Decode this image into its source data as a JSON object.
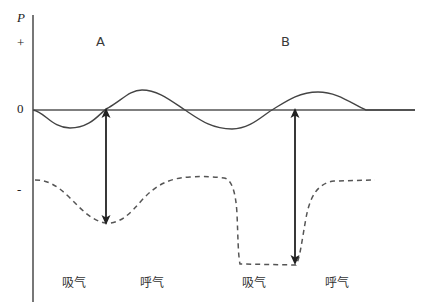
{
  "figure": {
    "background": "#ffffff",
    "width": 422,
    "height": 307,
    "line_color": "#444444",
    "dashed_color": "#555555",
    "arrow_color": "#222222"
  },
  "axes": {
    "y_axis_label": "P",
    "positive_label": "+",
    "zero_label": "0",
    "negative_label": "-",
    "y_axis_x": 33,
    "zero_line_y": 110
  },
  "cycles": [
    {
      "label": "A",
      "x": 100,
      "y": 42
    },
    {
      "label": "B",
      "x": 285,
      "y": 42
    }
  ],
  "phases": [
    {
      "label": "吸气",
      "x": 62,
      "y": 278
    },
    {
      "label": "呼气",
      "x": 140,
      "y": 278
    },
    {
      "label": "吸气",
      "x": 242,
      "y": 278
    },
    {
      "label": "呼气",
      "x": 325,
      "y": 278
    }
  ],
  "arrows": [
    {
      "name": "amplitude-arrow-a",
      "x": 106,
      "top": 108,
      "bottom": 225
    },
    {
      "name": "amplitude-arrow-b",
      "x": 295,
      "top": 108,
      "bottom": 265
    }
  ],
  "chart_data": {
    "type": "line",
    "title": "",
    "xlabel": "",
    "ylabel": "P",
    "ytick_labels": [
      "+",
      "0",
      "-"
    ],
    "grid": false,
    "legend": "none",
    "series": [
      {
        "name": "airway-pressure-solid",
        "style": "solid",
        "path": "M 33 110 C 45 112, 52 128, 70 128 C 92 128, 100 112, 108 108 C 122 100, 130 90, 142 90 C 158 90, 170 100, 185 110 C 200 120, 212 129, 232 129 C 250 129, 262 116, 272 110 C 285 102, 298 92, 318 92 C 338 92, 352 104, 366 110 L 415 110"
      },
      {
        "name": "intrapleural-pressure-dashed",
        "style": "dashed",
        "path": "M 35 180 C 48 180, 58 186, 70 198 C 82 210, 92 221, 106 223 C 120 224, 130 214, 142 200 C 155 186, 168 178, 190 177 C 205 176, 215 177, 224 178 C 232 179, 236 194, 237 214 C 238 236, 238 254, 240 264 L 296 265 C 300 258, 302 240, 306 218 C 310 196, 318 183, 334 181 L 375 180"
      }
    ]
  }
}
